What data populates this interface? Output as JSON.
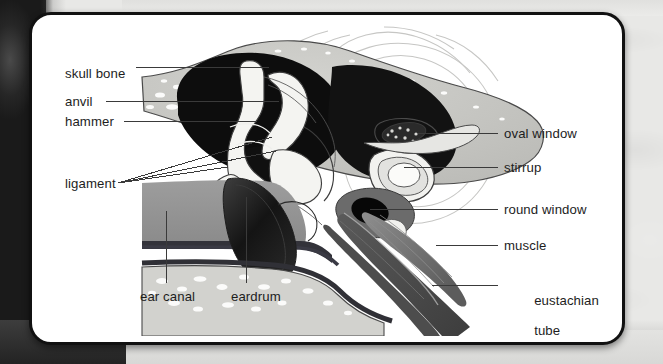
{
  "diagram": {
    "style": "grayscale anatomical illustration on white rounded card",
    "background_color": "#e8e8e6",
    "card_color": "#ffffff",
    "card_border_color": "#111111",
    "label_color": "#1d1d1d",
    "leader_line_color": "#3a3a3a"
  },
  "labels_left": [
    {
      "id": "skull-bone",
      "text": "skull bone",
      "x": 62,
      "y": 58
    },
    {
      "id": "anvil",
      "text": "anvil",
      "x": 62,
      "y": 92
    },
    {
      "id": "hammer",
      "text": "hammer",
      "x": 62,
      "y": 112
    },
    {
      "id": "ligament",
      "text": "ligament",
      "x": 62,
      "y": 175
    }
  ],
  "labels_bottom": [
    {
      "id": "ear-canal",
      "text": "ear canal",
      "x": 137,
      "y": 288
    },
    {
      "id": "eardrum",
      "text": "eardrum",
      "x": 228,
      "y": 288
    }
  ],
  "labels_right": [
    {
      "id": "oval-window",
      "text": "oval window",
      "x": 501,
      "y": 102
    },
    {
      "id": "stirrup",
      "text": "stirrup",
      "x": 501,
      "y": 134
    },
    {
      "id": "round-window",
      "text": "round window",
      "x": 501,
      "y": 172
    },
    {
      "id": "muscle",
      "text": "muscle",
      "x": 501,
      "y": 208
    },
    {
      "id": "eustachian-tube",
      "text": "eustachian",
      "text2": "tube",
      "x": 501,
      "y": 250
    }
  ],
  "structures": [
    {
      "id": "skull-bone",
      "name": "skull bone",
      "tone": "#c9c9c5",
      "note": "speckled spongy bone"
    },
    {
      "id": "middle-ear-cavity",
      "name": "middle ear cavity",
      "tone": "#101010",
      "note": "black air space"
    },
    {
      "id": "ossicles",
      "name": "ossicles (hammer, anvil, stirrup)",
      "tone": "#f2f2ef"
    },
    {
      "id": "ear-canal",
      "name": "ear canal",
      "tone": "#9a9a9a"
    },
    {
      "id": "eardrum",
      "name": "eardrum",
      "tone": "#1a1a1a"
    },
    {
      "id": "cochlea",
      "name": "cochlea spiral",
      "tone": "#d8d8d6",
      "note": "faint outline spiral"
    },
    {
      "id": "eustachian-tube",
      "name": "eustachian tube",
      "tone": "#4a4a4a"
    },
    {
      "id": "muscle",
      "name": "muscle",
      "tone": "#6e6e6e"
    },
    {
      "id": "round-window",
      "name": "round window",
      "tone": "#0d0d0d"
    }
  ]
}
